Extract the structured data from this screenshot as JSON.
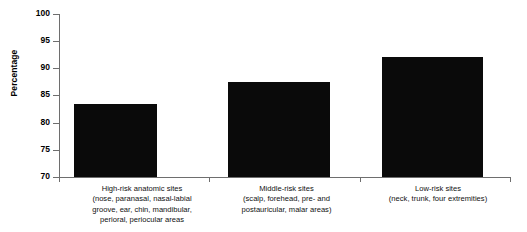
{
  "chart_data": {
    "type": "bar",
    "title": "",
    "xlabel": "",
    "ylabel": "Percentage",
    "ylim": [
      70,
      100
    ],
    "ytick_values": [
      100,
      95,
      90,
      85,
      80,
      75,
      70
    ],
    "grid": false,
    "legend": false,
    "bar_color": "#0a0a0a",
    "axis_color": "#6e6e6e",
    "categories": [
      "High-risk anatomic sites (nose, paranasal, nasal-labial groove, ear, chin, mandibular, perioral, periocular areas",
      "Middle-risk sites (scalp, forehead, pre- and postauricular, malar areas)",
      "Low-risk sites (neck, trunk, four extremities)"
    ],
    "category_lines": [
      [
        "High-risk anatomic sites",
        "(nose, paranasal, nasal-labial",
        "groove, ear, chin, mandibular,",
        "perioral, periocular areas"
      ],
      [
        "Middle-risk sites",
        "(scalp, forehead, pre- and",
        "postauricular, malar areas)"
      ],
      [
        "Low-risk sites",
        "(neck, trunk, four extremities)"
      ]
    ],
    "values": [
      83.5,
      87.5,
      92.0
    ]
  },
  "axis": {
    "ylabel": "Percentage",
    "ticks": {
      "t100": "100",
      "t95": "95",
      "t90": "90",
      "t85": "85",
      "t80": "80",
      "t75": "75",
      "t70": "70"
    }
  },
  "categories": {
    "c0": {
      "l0": "High-risk anatomic sites",
      "l1": "(nose, paranasal, nasal-labial",
      "l2": "groove, ear, chin, mandibular,",
      "l3": "perioral, periocular areas"
    },
    "c1": {
      "l0": "Middle-risk sites",
      "l1": "(scalp, forehead, pre- and",
      "l2": "postauricular, malar areas)"
    },
    "c2": {
      "l0": "Low-risk sites",
      "l1": "(neck, trunk, four extremities)"
    }
  }
}
